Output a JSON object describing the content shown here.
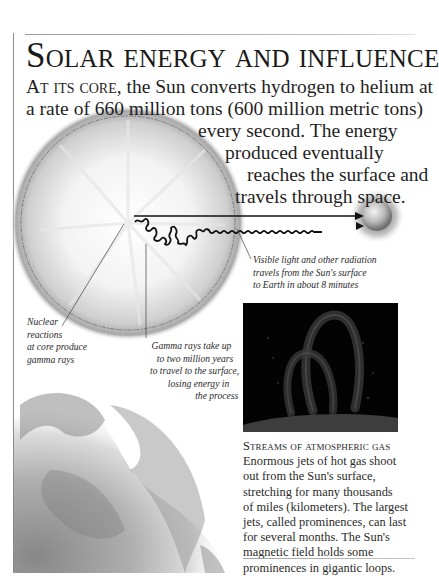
{
  "page": {
    "title": "Solar energy and influence",
    "intro": {
      "lead_in": "At its core,",
      "lines": [
        " the Sun converts hydrogen to helium at",
        "a rate of 660 million tons (600 million metric tons)",
        "every second. The energy",
        "produced eventually",
        "reaches the surface and",
        "travels through space."
      ]
    },
    "diagram": {
      "captions": {
        "visible_light": [
          "Visible light and other radiation",
          "travels from the Sun's surface",
          "to Earth in about 8 minutes"
        ],
        "nuclear": [
          "Nuclear",
          "reactions",
          "at core produce",
          "gamma rays"
        ],
        "gamma": [
          "Gamma rays take up",
          "to two million years",
          "to travel to the surface,",
          "losing energy in",
          "the process"
        ]
      },
      "labels": {
        "sun": "sun-cutaway-illustration",
        "earth": "earth-globe-illustration",
        "prominence_photo": "solar-prominence-photo",
        "corona": "solar-surface-illustration"
      }
    },
    "sidebar": {
      "heading": "Streams of atmospheric gas",
      "lines": [
        "Enormous jets of hot gas shoot",
        "out from the Sun's surface,",
        "stretching for many thousands",
        "of miles (kilometers). The largest",
        "jets, called prominences, can last",
        "for several months. The Sun's",
        "magnetic field holds some",
        "prominences in gigantic loops."
      ]
    },
    "colors": {
      "text": "#1c1c1c",
      "photo_bg": "#030303",
      "border": "#8a8a8a"
    }
  }
}
